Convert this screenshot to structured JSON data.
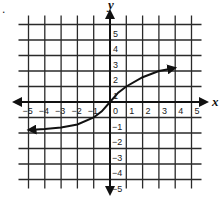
{
  "marker": ".",
  "chart_data": {
    "type": "line",
    "title": "",
    "xlabel": "x",
    "ylabel": "y",
    "xlim": [
      -5,
      5
    ],
    "ylim": [
      -5,
      5
    ],
    "grid": true,
    "x_ticks": [
      "-5",
      "-4",
      "-3",
      "-2",
      "-1",
      "0",
      "1",
      "2",
      "3",
      "4",
      "5"
    ],
    "y_ticks": [
      "5",
      "4",
      "3",
      "2",
      "1",
      "-1",
      "-2",
      "-3",
      "-4",
      "-5"
    ],
    "series": [
      {
        "name": "curve",
        "arrows_both_ends": true,
        "x": [
          -5,
          -4,
          -3,
          -2,
          -1,
          -0.5,
          0,
          0.5,
          1,
          2,
          3,
          4
        ],
        "y": [
          -1.8,
          -1.75,
          -1.65,
          -1.45,
          -1.0,
          -0.6,
          0,
          0.6,
          1.0,
          1.6,
          2.0,
          2.2
        ]
      }
    ]
  }
}
